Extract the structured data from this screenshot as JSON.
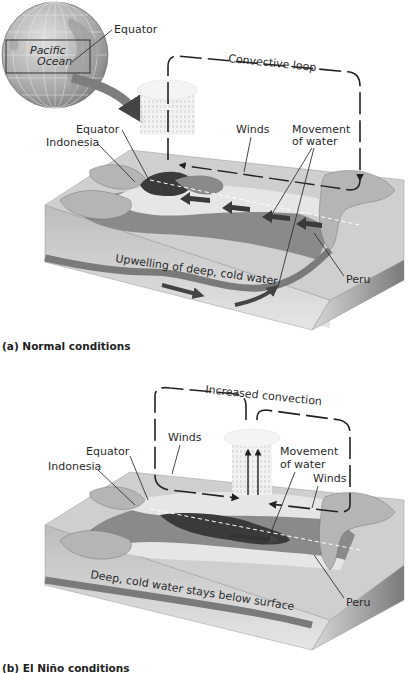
{
  "globe": {
    "ocean_label_line1": "Pacific",
    "ocean_label_line2": "Ocean",
    "equator_label": "Equator"
  },
  "panel_a": {
    "caption": "(a) Normal conditions",
    "loop_label": "Convective loop",
    "labels": {
      "equator": "Equator",
      "indonesia": "Indonesia",
      "winds": "Winds",
      "movement_line1": "Movement",
      "movement_line2": "of water",
      "peru": "Peru",
      "upwelling": "Upwelling  of deep,  cold water"
    }
  },
  "panel_b": {
    "caption": "(b) El Niño conditions",
    "loop_label": "Increased convection",
    "labels": {
      "equator": "Equator",
      "indonesia": "Indonesia",
      "winds_left": "Winds",
      "winds_right": "Winds",
      "movement_line1": "Movement",
      "movement_line2": "of water",
      "peru": "Peru",
      "deep_water": "Deep, cold water stays below surface"
    }
  },
  "colors": {
    "dark_water": "#3a3a3a",
    "mid_water": "#8a8a8a",
    "light_water": "#d6d6d6",
    "land": "#b5b5b5",
    "box_side": "#c8c8c8",
    "box_right": "#9a9a9a",
    "globe_arrow": "#7d7d7d"
  }
}
